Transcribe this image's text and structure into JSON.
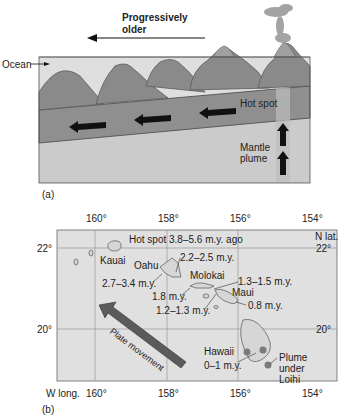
{
  "panel_a": {
    "label": "(a)",
    "title_line1": "Progressively",
    "title_line2": "older",
    "ocean_label": "Ocean",
    "hot_spot_label": "Hot spot",
    "mantle_line1": "Mantle",
    "mantle_line2": "plume"
  },
  "panel_b": {
    "label": "(b)",
    "top_lon_ticks": [
      "160°",
      "158°",
      "156°",
      "154°"
    ],
    "bottom_lon_ticks": [
      "160°",
      "158°",
      "156°",
      "154°"
    ],
    "lon_axis_label": "W long.",
    "lat_axis_label": "N lat.",
    "lat_ticks_left": [
      "22°",
      "20°"
    ],
    "lat_ticks_right": [
      "22°",
      "20°"
    ],
    "hot_spot_title": "Hot spot 3.8–5.6 m.y. ago",
    "islands": {
      "kauai": "Kauai",
      "oahu": "Oahu",
      "molokai": "Molokai",
      "maui": "Maui",
      "hawaii": "Hawaii"
    },
    "ages": {
      "oahu_west": "2.7–3.4 m.y.",
      "oahu_east": "2.2–2.5 m.y.",
      "molokai_west": "1.8 m.y.",
      "molokai_east": "1.3–1.5 m.y.",
      "maui_west": "1.2–1.3 m.y.",
      "maui_east": "0.8 m.y.",
      "hawaii": "0–1 m.y."
    },
    "plate_movement": "Plate movement",
    "plume_line1": "Plume",
    "plume_line2": "under",
    "plume_line3": "Loihi"
  },
  "colors": {
    "ocean": "#dcdcdc",
    "volcano": "#8c8c8c",
    "plate": "#8e8e8e",
    "mantle": "#cdcdcd",
    "arrow": "#111111",
    "map_bg": "#e2e2e2",
    "plate_arrow": "#5a5a5a",
    "hotspot_dot": "#7a7a7a"
  }
}
